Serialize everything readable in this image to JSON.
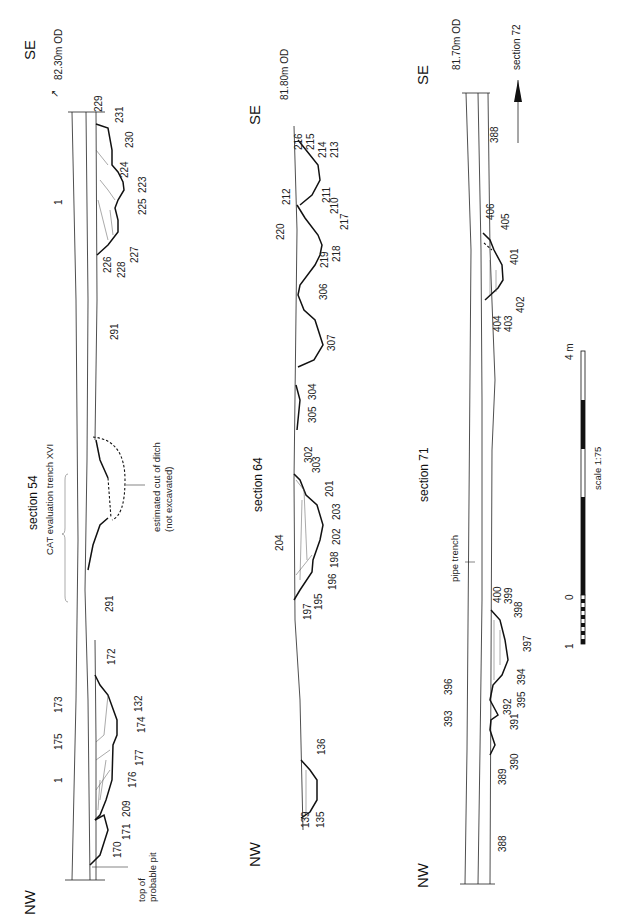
{
  "scale_bar": {
    "label": "scale 1:75",
    "tick_start": "1",
    "tick_zero": "0",
    "tick_end": "4 m"
  },
  "sections": [
    {
      "title": "section 54",
      "left_end": "SE",
      "right_end": "NW",
      "datum": "82.30m OD",
      "annotations": {
        "evaluation_trench": "CAT evaluation trench XVI",
        "ditch_note_1": "estimated cut of ditch",
        "ditch_note_2": "(not excavated)",
        "pit_note_1": "top of",
        "pit_note_2": "probable pit"
      },
      "contexts": [
        "229",
        "231",
        "230",
        "224",
        "223",
        "225",
        "227",
        "228",
        "226",
        "1",
        "291",
        "291",
        "172",
        "173",
        "132",
        "174",
        "175",
        "177",
        "1",
        "176",
        "209",
        "171",
        "170"
      ]
    },
    {
      "title": "section 64",
      "left_end": "SE",
      "right_end": "NW",
      "datum": "81.80m OD",
      "contexts": [
        "216",
        "215",
        "214",
        "213",
        "212",
        "211",
        "210",
        "217",
        "220",
        "218",
        "219",
        "306",
        "307",
        "304",
        "305",
        "302",
        "303",
        "201",
        "203",
        "204",
        "202",
        "198",
        "196",
        "197",
        "195",
        "136",
        "139",
        "135"
      ]
    },
    {
      "title": "section 71",
      "left_end": "SE",
      "right_end": "NW",
      "datum": "81.70m OD",
      "arrow_label": "section 72",
      "annotations": {
        "pipe_trench": "pipe trench"
      },
      "contexts": [
        "388",
        "406",
        "405",
        "401",
        "402",
        "403",
        "404",
        "400",
        "399",
        "398",
        "397",
        "396",
        "394",
        "395",
        "393",
        "392",
        "391",
        "390",
        "389",
        "388"
      ]
    }
  ]
}
